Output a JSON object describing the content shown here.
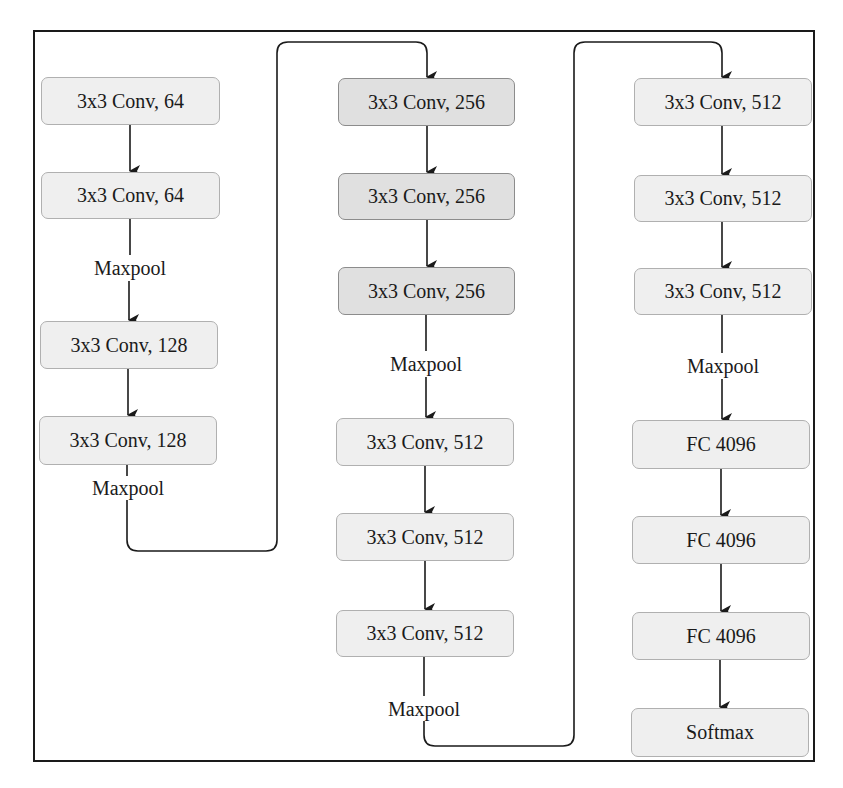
{
  "diagram": {
    "colors": {
      "frame": "#1a1a1a",
      "box_fill_light": "#efefef",
      "box_fill_dark": "#e0e0e0",
      "box_border": "#a8a8a8",
      "arrow": "#1a1a1a",
      "text": "#1a1a1a"
    },
    "columns": [
      {
        "layers": [
          {
            "label": "3x3 Conv, 64",
            "x": 41,
            "y": 77,
            "w": 179,
            "h": 48,
            "tone": "light"
          },
          {
            "label": "3x3 Conv, 64",
            "x": 41,
            "y": 172,
            "w": 179,
            "h": 47,
            "tone": "light"
          },
          {
            "label": "3x3 Conv, 128",
            "x": 40,
            "y": 321,
            "w": 178,
            "h": 48,
            "tone": "light"
          },
          {
            "label": "3x3 Conv, 128",
            "x": 39,
            "y": 416,
            "w": 178,
            "h": 49,
            "tone": "light"
          }
        ],
        "pool_labels": [
          {
            "label": "Maxpool",
            "cx": 130,
            "cy": 268
          },
          {
            "label": "Maxpool",
            "cx": 128,
            "cy": 488
          }
        ]
      },
      {
        "layers": [
          {
            "label": "3x3 Conv, 256",
            "x": 338,
            "y": 78,
            "w": 177,
            "h": 48,
            "tone": "dark"
          },
          {
            "label": "3x3 Conv, 256",
            "x": 338,
            "y": 173,
            "w": 177,
            "h": 47,
            "tone": "dark"
          },
          {
            "label": "3x3 Conv, 256",
            "x": 338,
            "y": 267,
            "w": 177,
            "h": 48,
            "tone": "dark"
          },
          {
            "label": "3x3 Conv, 512",
            "x": 336,
            "y": 418,
            "w": 178,
            "h": 48,
            "tone": "light"
          },
          {
            "label": "3x3 Conv, 512",
            "x": 336,
            "y": 513,
            "w": 178,
            "h": 48,
            "tone": "light"
          },
          {
            "label": "3x3 Conv, 512",
            "x": 336,
            "y": 610,
            "w": 178,
            "h": 47,
            "tone": "light"
          }
        ],
        "pool_labels": [
          {
            "label": "Maxpool",
            "cx": 426,
            "cy": 364
          },
          {
            "label": "Maxpool",
            "cx": 424,
            "cy": 709
          }
        ]
      },
      {
        "layers": [
          {
            "label": "3x3 Conv, 512",
            "x": 634,
            "y": 78,
            "w": 178,
            "h": 48,
            "tone": "light"
          },
          {
            "label": "3x3 Conv, 512",
            "x": 634,
            "y": 175,
            "w": 178,
            "h": 47,
            "tone": "light"
          },
          {
            "label": "3x3 Conv, 512",
            "x": 634,
            "y": 268,
            "w": 178,
            "h": 47,
            "tone": "light"
          },
          {
            "label": "FC 4096",
            "x": 632,
            "y": 420,
            "w": 178,
            "h": 49,
            "tone": "light"
          },
          {
            "label": "FC 4096",
            "x": 632,
            "y": 516,
            "w": 178,
            "h": 48,
            "tone": "light"
          },
          {
            "label": "FC 4096",
            "x": 632,
            "y": 612,
            "w": 178,
            "h": 48,
            "tone": "light"
          },
          {
            "label": "Softmax",
            "x": 631,
            "y": 708,
            "w": 178,
            "h": 49,
            "tone": "light"
          }
        ],
        "pool_labels": [
          {
            "label": "Maxpool",
            "cx": 723,
            "cy": 366
          }
        ]
      }
    ]
  }
}
